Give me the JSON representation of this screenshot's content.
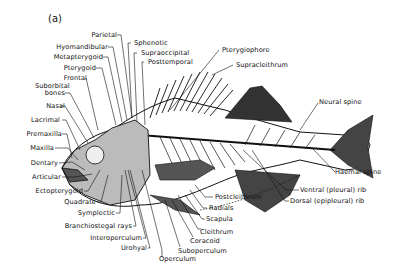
{
  "figure": {
    "panel_label": "(a)",
    "labels_left": {
      "parietal": "Parietal",
      "hyomandibular": "Hyomandibular",
      "metapterygoid": "Metapterygoid",
      "pterygoid": "Pterygoid",
      "frontal": "Frontal",
      "suborbital": "Suborbital",
      "bones": "bones",
      "nasal": "Nasal",
      "lacrimal": "Lacrimal",
      "premaxilla": "Premaxilla",
      "maxilla": "Maxilla",
      "dentary": "Dentary",
      "articular": "Articular",
      "ectopterygoid": "Ectopterygoid",
      "quadrate": "Quadrate",
      "symplectic": "Symplectic",
      "branchiostegal": "Branchiostegal rays",
      "interoperculum": "Interoperculum",
      "urohyal": "Urohyal",
      "operculum": "Operculum"
    },
    "labels_top": {
      "sphenotic": "Sphenotic",
      "supraoccipital": "Supraoccipital",
      "posttemporal": "Posttemporal",
      "pterygiophore": "Pterygiophore",
      "supracleithrum": "Supracleithrum"
    },
    "labels_right": {
      "neural_spine": "Neural spine",
      "haemal_spine": "Haemal spine",
      "ventral_rib": "Ventral (pleural) rib",
      "dorsal_rib": "Dorsal (epipleural) rib",
      "postcleithrum": "Postcleithrum",
      "radials": "Radials",
      "scapula": "Scapula",
      "cleithrum": "Cleithrum",
      "coracoid": "Coracoid",
      "suboperculum": "Suboperculum"
    }
  }
}
